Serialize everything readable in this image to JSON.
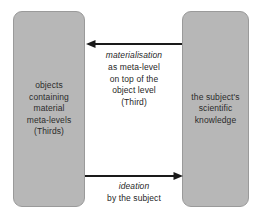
{
  "diagram": {
    "background_color": "#ffffff",
    "node_fill_color": "#b7b7b7",
    "node_border_color": "#9a9a9a",
    "text_color": "#2b2b2b",
    "arrow_color": "#1a1a1a"
  },
  "nodes": {
    "left": {
      "id": "objects-containing-material-meta-levels",
      "text": "objects\ncontaining\nmaterial\nmeta-levels\n(Thirds)"
    },
    "right": {
      "id": "subjects-scientific-knowledge",
      "text": "the subject's\nscientific\nknowledge"
    }
  },
  "edges": {
    "top": {
      "id": "materialisation-edge",
      "direction": "right-to-left",
      "emphasis": "materialisation",
      "detail": "as meta-level\non top of the\nobject level\n(Third)"
    },
    "bottom": {
      "id": "ideation-edge",
      "direction": "left-to-right",
      "emphasis": "ideation",
      "detail": "by the subject"
    }
  }
}
